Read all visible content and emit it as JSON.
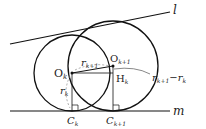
{
  "diagram": {
    "colors": {
      "stroke": "#111111",
      "dashed": "#888888",
      "background": "#ffffff"
    },
    "lines": {
      "l": {
        "label": "l",
        "from": [
          10,
          44
        ],
        "to": [
          170,
          12
        ]
      },
      "m": {
        "label": "m",
        "from": [
          10,
          111
        ],
        "to": [
          170,
          111
        ]
      }
    },
    "circles": [
      {
        "name": "circle-k",
        "center_label": "O",
        "center_sub": "k",
        "cx": 72,
        "cy": 73,
        "r": 38
      },
      {
        "name": "circle-k1",
        "center_label": "O",
        "center_sub": "k+1",
        "cx": 113,
        "cy": 66,
        "r": 45
      }
    ],
    "points": {
      "Ok": {
        "label": "O",
        "sub": "k"
      },
      "Ok1": {
        "label": "O",
        "sub": "k+1"
      },
      "Hk": {
        "label": "H",
        "sub": "k"
      },
      "Ck": {
        "label": "C",
        "sub": "k"
      },
      "Ck1": {
        "label": "C",
        "sub": "k+1"
      }
    },
    "lengths": {
      "rk": {
        "label": "r",
        "sub": "k"
      },
      "rk1": {
        "label": "r",
        "sub": "k+1"
      },
      "diff": {
        "r1": "r",
        "s1": "k+1",
        "minus": "−",
        "r2": "r",
        "s2": "k"
      }
    }
  }
}
